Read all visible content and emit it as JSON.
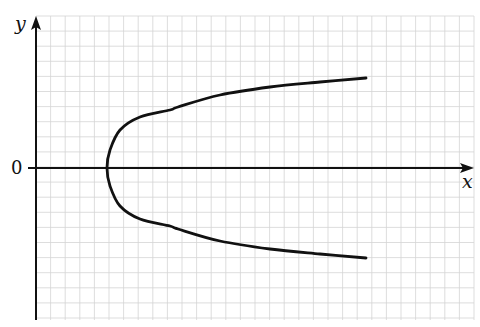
{
  "graph": {
    "y_axis_label": "y",
    "x_axis_label": "x",
    "origin_label": "0",
    "colors": {
      "background": "#ffffff",
      "grid": "#d4d4d4",
      "axis": "#111111",
      "curve": "#111111"
    },
    "grid": {
      "left": 36,
      "top": 16,
      "right": 474,
      "bottom": 320,
      "dx": 14.6,
      "dy": 15.1
    },
    "axes": {
      "origin_px": [
        36,
        168
      ],
      "x_axis_start_px": 28,
      "x_axis_end_px": 474,
      "y_axis_top_px": 16,
      "y_axis_bottom_px": 320
    },
    "curve": {
      "description": "Sideways U-shaped curve symmetric about the x-axis, vertex on the positive x-axis, opening to the right",
      "vertex_px": [
        107,
        168
      ],
      "upper_branch_px": [
        [
          107,
          168
        ],
        [
          110,
          150
        ],
        [
          120,
          130
        ],
        [
          140,
          117
        ],
        [
          170,
          110
        ],
        [
          178,
          107
        ],
        [
          220,
          95
        ],
        [
          270,
          87
        ],
        [
          320,
          82
        ],
        [
          366,
          78
        ]
      ],
      "lower_branch_px": [
        [
          107,
          168
        ],
        [
          110,
          186
        ],
        [
          120,
          206
        ],
        [
          140,
          219
        ],
        [
          170,
          226
        ],
        [
          178,
          229
        ],
        [
          220,
          241
        ],
        [
          270,
          249
        ],
        [
          320,
          254
        ],
        [
          366,
          258
        ]
      ]
    }
  },
  "chart_data": {
    "type": "line",
    "title": "",
    "xlabel": "x",
    "ylabel": "y",
    "tick_labels": [
      "0"
    ],
    "grid": true,
    "series": [
      {
        "name": "upper branch",
        "x_px": [
          107,
          110,
          120,
          140,
          170,
          220,
          270,
          320,
          366
        ],
        "y_px": [
          168,
          150,
          130,
          117,
          110,
          95,
          87,
          82,
          78
        ]
      },
      {
        "name": "lower branch",
        "x_px": [
          107,
          110,
          120,
          140,
          170,
          220,
          270,
          320,
          366
        ],
        "y_px": [
          168,
          186,
          206,
          219,
          226,
          241,
          249,
          254,
          258
        ]
      }
    ]
  }
}
